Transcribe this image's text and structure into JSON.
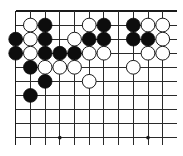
{
  "board": {
    "description": "Go board diagram, top-left corner region",
    "columns_visible": 11,
    "rows_visible": 10,
    "origin_x": 15.7,
    "origin_y": 11,
    "spacing_x": 14.7,
    "spacing_y": 14.07,
    "line_end_x": 176.5,
    "line_end_y": 145,
    "stone_radius": 6.9,
    "colors": {
      "background": "#ffffff",
      "lines": "#2a2a2a",
      "black_stone": "#0d0d0d",
      "white_stone": "#ffffff"
    },
    "star_points": [
      {
        "col": 3,
        "row": 9
      },
      {
        "col": 9,
        "row": 9
      }
    ],
    "stones": [
      {
        "col": 1,
        "row": 1,
        "color": "white"
      },
      {
        "col": 2,
        "row": 1,
        "color": "black"
      },
      {
        "col": 5,
        "row": 1,
        "color": "white"
      },
      {
        "col": 6,
        "row": 1,
        "color": "black"
      },
      {
        "col": 8,
        "row": 1,
        "color": "black"
      },
      {
        "col": 9,
        "row": 1,
        "color": "white"
      },
      {
        "col": 10,
        "row": 1,
        "color": "white"
      },
      {
        "col": 0,
        "row": 2,
        "color": "black"
      },
      {
        "col": 1,
        "row": 2,
        "color": "white"
      },
      {
        "col": 2,
        "row": 2,
        "color": "black"
      },
      {
        "col": 4,
        "row": 2,
        "color": "white"
      },
      {
        "col": 5,
        "row": 2,
        "color": "black"
      },
      {
        "col": 6,
        "row": 2,
        "color": "black"
      },
      {
        "col": 8,
        "row": 2,
        "color": "black"
      },
      {
        "col": 9,
        "row": 2,
        "color": "black"
      },
      {
        "col": 10,
        "row": 2,
        "color": "white"
      },
      {
        "col": 0,
        "row": 3,
        "color": "black"
      },
      {
        "col": 1,
        "row": 3,
        "color": "white"
      },
      {
        "col": 2,
        "row": 3,
        "color": "black"
      },
      {
        "col": 3,
        "row": 3,
        "color": "black"
      },
      {
        "col": 4,
        "row": 3,
        "color": "black"
      },
      {
        "col": 5,
        "row": 3,
        "color": "white"
      },
      {
        "col": 6,
        "row": 3,
        "color": "white"
      },
      {
        "col": 9,
        "row": 3,
        "color": "white"
      },
      {
        "col": 10,
        "row": 3,
        "color": "white"
      },
      {
        "col": 1,
        "row": 4,
        "color": "black"
      },
      {
        "col": 2,
        "row": 4,
        "color": "white"
      },
      {
        "col": 3,
        "row": 4,
        "color": "white"
      },
      {
        "col": 4,
        "row": 4,
        "color": "white"
      },
      {
        "col": 8,
        "row": 4,
        "color": "white"
      },
      {
        "col": 2,
        "row": 5,
        "color": "black"
      },
      {
        "col": 5,
        "row": 5,
        "color": "white"
      },
      {
        "col": 1,
        "row": 6,
        "color": "black"
      }
    ],
    "stone_counts": {
      "black": 16,
      "white": 17
    }
  }
}
